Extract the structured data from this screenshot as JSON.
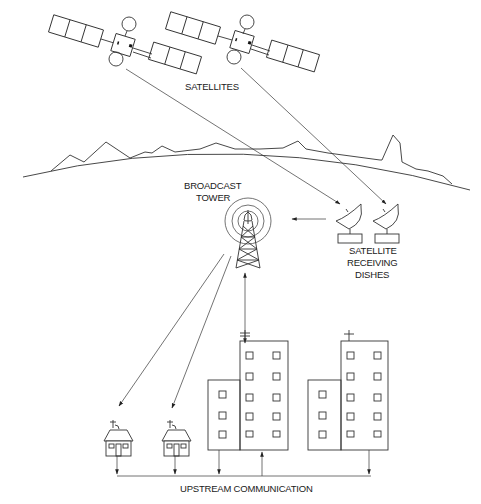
{
  "diagram": {
    "labels": {
      "satellites": "SATELLITES",
      "broadcast_tower_line1": "BROADCAST",
      "broadcast_tower_line2": "TOWER",
      "dishes_line1": "SATELLITE",
      "dishes_line2": "RECEIVING",
      "dishes_line3": "DISHES",
      "upstream": "UPSTREAM COMMUNICATION"
    },
    "nodes": [
      {
        "id": "satellite-1",
        "type": "satellite"
      },
      {
        "id": "satellite-2",
        "type": "satellite"
      },
      {
        "id": "broadcast-tower",
        "type": "tower"
      },
      {
        "id": "dish-1",
        "type": "satellite-dish"
      },
      {
        "id": "dish-2",
        "type": "satellite-dish"
      },
      {
        "id": "house-1",
        "type": "house"
      },
      {
        "id": "house-2",
        "type": "house"
      },
      {
        "id": "building-1",
        "type": "apartment-building"
      },
      {
        "id": "building-2",
        "type": "apartment-building"
      }
    ],
    "edges": [
      {
        "from": "satellite-1",
        "to": "dish-1"
      },
      {
        "from": "satellite-2",
        "to": "dish-2"
      },
      {
        "from": "dish-1",
        "to": "broadcast-tower"
      },
      {
        "from": "broadcast-tower",
        "to": "house-1"
      },
      {
        "from": "broadcast-tower",
        "to": "house-2"
      },
      {
        "from": "broadcast-tower",
        "to": "building-1",
        "bidirectional": true
      },
      {
        "from": "house-1",
        "to": "upstream-line"
      },
      {
        "from": "house-2",
        "to": "upstream-line"
      },
      {
        "from": "building-1",
        "to": "upstream-line"
      },
      {
        "from": "upstream-line",
        "to": "building-1"
      },
      {
        "from": "building-2",
        "to": "upstream-line"
      }
    ],
    "colors": {
      "stroke": "#333333",
      "background": "#ffffff",
      "text": "#1a1a1a"
    }
  }
}
